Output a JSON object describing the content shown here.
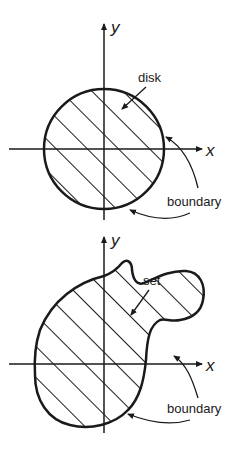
{
  "top_diagram": {
    "axis_x_label": "x",
    "axis_y_label": "y",
    "region_label": "disk",
    "boundary_label": "boundary"
  },
  "bottom_diagram": {
    "axis_x_label": "x",
    "axis_y_label": "y",
    "region_label": "set",
    "boundary_label": "boundary"
  },
  "colors": {
    "ink": "#1a1a1a",
    "background": "#ffffff"
  }
}
